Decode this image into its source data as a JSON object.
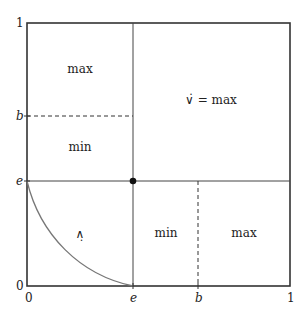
{
  "diagram": {
    "axes": {
      "x_ticks": [
        "0",
        "e",
        "b",
        "1"
      ],
      "y_ticks": [
        "0",
        "e",
        "b",
        "1"
      ]
    },
    "regions": {
      "top_left_upper": "max",
      "top_left_lower": "min",
      "top_right": "∨̇ = max",
      "bottom_left": "∧̣",
      "bottom_middle": "min",
      "bottom_right": "max"
    },
    "colors": {
      "frame": "#333333",
      "curve": "#777777",
      "point": "#111111"
    }
  }
}
